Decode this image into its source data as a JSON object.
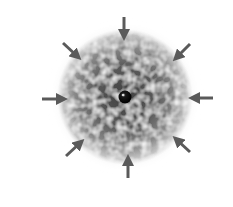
{
  "diagram": {
    "canvas": {
      "width": 233,
      "height": 207,
      "background": "#ffffff"
    },
    "cloud": {
      "center": [
        125,
        97
      ],
      "outer_radius": 66,
      "inner_radius": 40,
      "outer_color": "#8f8f8f",
      "inner_color": "#4a4a4a",
      "halo_color": "#d8d8d8"
    },
    "core": {
      "center": [
        125,
        97
      ],
      "radius": 6,
      "color": "#0a0a0a",
      "highlight_color": "#e8e8e8"
    },
    "arrow_color": "#5a5a5a",
    "arrows": [
      {
        "id": "top",
        "from": [
          124,
          17
        ],
        "to": [
          124,
          35
        ]
      },
      {
        "id": "top-right",
        "from": [
          190,
          44
        ],
        "to": [
          177,
          57
        ]
      },
      {
        "id": "right",
        "from": [
          213,
          98
        ],
        "to": [
          194,
          98
        ]
      },
      {
        "id": "bottom-right",
        "from": [
          190,
          152
        ],
        "to": [
          177,
          140
        ]
      },
      {
        "id": "bottom",
        "from": [
          128,
          178
        ],
        "to": [
          128,
          160
        ]
      },
      {
        "id": "bottom-left",
        "from": [
          66,
          156
        ],
        "to": [
          80,
          143
        ]
      },
      {
        "id": "left",
        "from": [
          42,
          99
        ],
        "to": [
          62,
          99
        ]
      },
      {
        "id": "top-left",
        "from": [
          63,
          43
        ],
        "to": [
          77,
          56
        ]
      }
    ]
  }
}
